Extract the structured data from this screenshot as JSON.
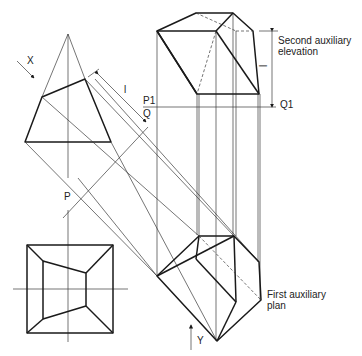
{
  "labels": {
    "x_arrow": "X",
    "y_arrow": "Y",
    "p": "P",
    "q": "Q",
    "p1": "P1",
    "q1": "Q1",
    "l": "l",
    "l_dim": "l",
    "second_aux_line1": "Second auxiliary",
    "second_aux_line2": "elevation",
    "first_aux_line1": "First auxiliary",
    "first_aux_line2": "plan"
  },
  "colors": {
    "line": "#1a1a1a",
    "construction": "#3a3a3a",
    "background": "#ffffff"
  }
}
